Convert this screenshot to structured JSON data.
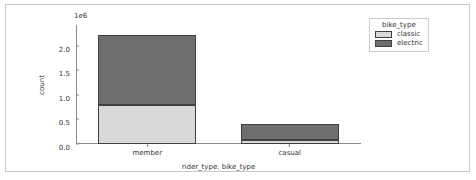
{
  "chart_data": {
    "type": "bar",
    "title": "",
    "xlabel": "rider_type, bike_type",
    "ylabel": "count",
    "categories": [
      "member",
      "casual"
    ],
    "stacked": true,
    "y_offset_label": "1e6",
    "y_offset_multiplier": 1000000,
    "ylim": [
      0,
      2.42
    ],
    "yticks": [
      "0.0",
      "0.5",
      "1.0",
      "1.5",
      "2.0"
    ],
    "ytick_values": [
      0.0,
      0.5,
      1.0,
      1.5,
      2.0
    ],
    "grid": false,
    "series": [
      {
        "name": "classic",
        "color": "#d9d9d9",
        "values": [
          0.79,
          0.08
        ]
      },
      {
        "name": "electric",
        "color": "#6e6e6e",
        "values": [
          1.42,
          0.33
        ]
      }
    ],
    "totals": [
      2.21,
      0.41
    ],
    "legend": {
      "title": "bike_type",
      "position": "upper right",
      "entries": [
        {
          "label": "classic",
          "color": "#d9d9d9"
        },
        {
          "label": "electric",
          "color": "#6e6e6e"
        }
      ]
    }
  }
}
